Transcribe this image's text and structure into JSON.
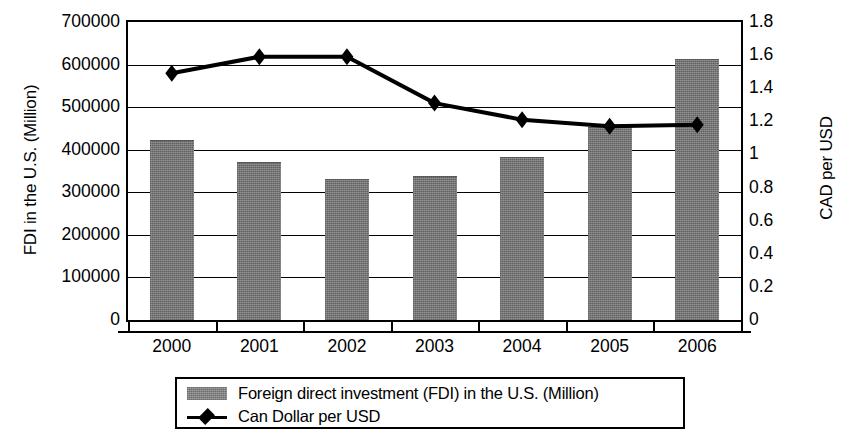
{
  "chart_data": {
    "type": "bar",
    "title": "",
    "subtitle": "",
    "categories": [
      "2000",
      "2001",
      "2002",
      "2003",
      "2004",
      "2005",
      "2006"
    ],
    "xlabel": "",
    "grid": true,
    "legend_position": "bottom",
    "axes": {
      "left": {
        "label": "FDI in the U.S. (Million)",
        "ticks": [
          "0",
          "100000",
          "200000",
          "300000",
          "400000",
          "500000",
          "600000",
          "700000"
        ],
        "tick_values": [
          0,
          100000,
          200000,
          300000,
          400000,
          500000,
          600000,
          700000
        ],
        "range": [
          0,
          700000
        ]
      },
      "right": {
        "label": "CAD per USD",
        "ticks": [
          "0",
          "0.2",
          "0.4",
          "0.6",
          "0.8",
          "1",
          "1.2",
          "1.4",
          "1.6",
          "1.8"
        ],
        "tick_values": [
          0,
          0.2,
          0.4,
          0.6,
          0.8,
          1.0,
          1.2,
          1.4,
          1.6,
          1.8
        ],
        "range": [
          0,
          1.8
        ]
      }
    },
    "series": [
      {
        "name": "Foreign direct investment (FDI) in the U.S. (Million)",
        "type": "bar",
        "axis": "left",
        "color": "#7c7c7c",
        "values": [
          420000,
          370000,
          330000,
          335000,
          380000,
          450000,
          610000
        ]
      },
      {
        "name": "Can Dollar per USD",
        "type": "line",
        "axis": "right",
        "color": "#000000",
        "marker": "diamond",
        "values": [
          1.49,
          1.59,
          1.59,
          1.31,
          1.21,
          1.17,
          1.18
        ]
      }
    ]
  },
  "legend": {
    "entries": [
      {
        "marker": "bar-swatch",
        "label": "Foreign direct investment (FDI) in the U.S. (Million)"
      },
      {
        "marker": "line-diamond",
        "label": "Can Dollar per USD"
      }
    ]
  }
}
